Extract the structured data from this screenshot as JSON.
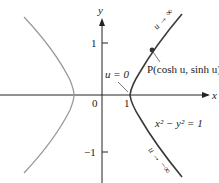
{
  "diagram": {
    "type": "hyperbola-plot",
    "equation_label": "x² − y² = 1",
    "axes": {
      "x_label": "x",
      "y_label": "y",
      "x_ticks": [
        {
          "label": "0"
        },
        {
          "label": "1"
        }
      ],
      "y_ticks": [
        {
          "label": "1"
        },
        {
          "label": "−1"
        }
      ]
    },
    "annotations": {
      "vertex_label": "u = 0",
      "point_label": "P(cosh u, sinh u)",
      "upper_arrow_label": "u → ∞",
      "lower_arrow_label": "u → −∞"
    },
    "colors": {
      "right_branch": "#3a3a3a",
      "left_branch": "#9a9a9a",
      "axes": "#222222"
    }
  }
}
